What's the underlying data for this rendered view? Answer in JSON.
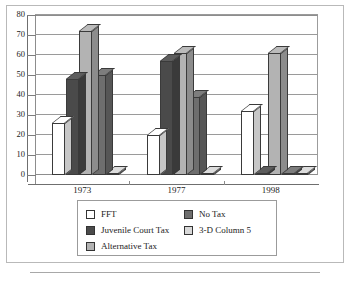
{
  "chart_data": {
    "type": "bar",
    "title": "",
    "subtitle": "",
    "xlabel": "",
    "ylabel": "",
    "categories": [
      "1973",
      "1977",
      "1998"
    ],
    "ylim": [
      0,
      80
    ],
    "yticks": [
      0,
      10,
      20,
      30,
      40,
      50,
      60,
      70,
      80
    ],
    "grid": true,
    "three_d": true,
    "legend_position": "bottom",
    "series": [
      {
        "name": "FFT",
        "color": "#ffffff",
        "values": [
          26,
          20,
          32
        ]
      },
      {
        "name": "Juvenile Court Tax",
        "color": "#4a4a4a",
        "values": [
          48,
          57,
          0
        ]
      },
      {
        "name": "Alternative Tax",
        "color": "#b3b3b3",
        "values": [
          72,
          61,
          61
        ]
      },
      {
        "name": "No Tax",
        "color": "#6e6e6e",
        "values": [
          50,
          39,
          0
        ]
      },
      {
        "name": "3-D Column 5",
        "color": "#d8d8d8",
        "values": [
          1,
          1,
          1
        ]
      }
    ]
  },
  "legend": {
    "items": [
      {
        "label": "FFT",
        "color": "#ffffff"
      },
      {
        "label": "Juvenile Court Tax",
        "color": "#4a4a4a"
      },
      {
        "label": "Alternative Tax",
        "color": "#b3b3b3"
      },
      {
        "label": "No Tax",
        "color": "#6e6e6e"
      },
      {
        "label": "3-D Column 5",
        "color": "#d8d8d8"
      }
    ]
  },
  "axis": {
    "y_tick_labels": [
      "80",
      "70",
      "60",
      "50",
      "40",
      "30",
      "20",
      "10",
      "0"
    ],
    "x_tick_labels": [
      "1973",
      "1977",
      "1998"
    ]
  }
}
